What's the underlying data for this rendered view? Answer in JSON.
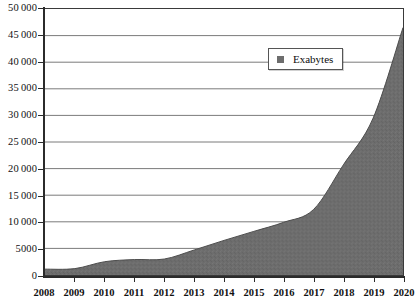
{
  "chart_data": {
    "type": "area",
    "title": "",
    "subtitle": "",
    "xlabel": "",
    "ylabel": "",
    "grid": true,
    "legend_position": "top-right",
    "x": [
      2008,
      2009,
      2010,
      2011,
      2012,
      2013,
      2014,
      2015,
      2016,
      2017,
      2018,
      2019,
      2020
    ],
    "categories": [
      "2008",
      "2009",
      "2010",
      "2011",
      "2012",
      "2013",
      "2014",
      "2015",
      "2016",
      "2017",
      "2018",
      "2019",
      "2020"
    ],
    "series": [
      {
        "name": "Exabytes",
        "values": [
          1100,
          1200,
          2500,
          2900,
          3000,
          4700,
          6500,
          8200,
          9900,
          12300,
          20700,
          29500,
          46500
        ]
      }
    ],
    "ylim": [
      0,
      50000
    ],
    "xlim": [
      2008,
      2020
    ],
    "ytick_values": [
      0,
      5000,
      10000,
      15000,
      20000,
      25000,
      30000,
      35000,
      40000,
      45000,
      50000
    ],
    "ytick_labels": [
      "0",
      "5000",
      "10 000",
      "15 000",
      "20 000",
      "25 000",
      "30 000",
      "35 000",
      "40 000",
      "45 000",
      "50 000"
    ],
    "xtick_labels": [
      "2008",
      "2009",
      "2010",
      "2011",
      "2012",
      "2013",
      "2014",
      "2015",
      "2016",
      "2017",
      "2018",
      "2019",
      "2020"
    ],
    "annotations": []
  },
  "legend": {
    "entries": [
      {
        "label": "Exabytes",
        "swatch": "legend-swatch-square",
        "color": "#6d6d6d"
      }
    ]
  },
  "colors": {
    "area_fill": "#6d6d6d",
    "area_edge": "#4a4a4a",
    "gridline": "#7a7a7a",
    "axis": "#2b2b2b",
    "frame": "#3a3a3a",
    "text": "#111111",
    "background": "#ffffff"
  }
}
